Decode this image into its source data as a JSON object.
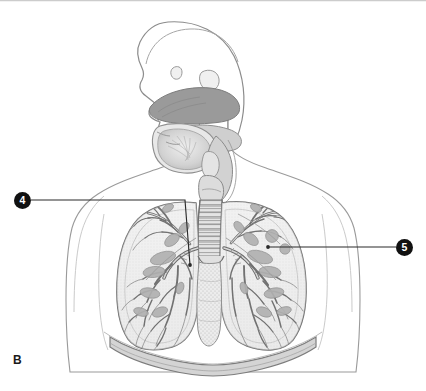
{
  "figure": {
    "panel_label": "B",
    "background_color": "#ffffff",
    "width": 426,
    "height": 391
  },
  "callouts": [
    {
      "id": "4",
      "label": "4",
      "marker_color": "#111111",
      "text_color": "#ffffff",
      "marker_x": 22,
      "marker_y": 200,
      "leader_points": "31,200 185,200 190,265",
      "target_x": 190,
      "target_y": 265,
      "target_region": "left-lung-hilum-primary-bronchus"
    },
    {
      "id": "5",
      "label": "5",
      "marker_color": "#111111",
      "text_color": "#ffffff",
      "marker_x": 404,
      "marker_y": 247,
      "leader_points": "396,247 268,247",
      "target_x": 268,
      "target_y": 247,
      "target_region": "right-lung-bronchial-tree"
    }
  ],
  "palette": {
    "outline": "#8c8c8c",
    "dark_outline": "#5a5a5a",
    "leader_line": "#2b2b2b",
    "fill_light": "#f2f2f2",
    "fill_mid": "#d6d6d6",
    "fill_gray": "#b8b8b8",
    "fill_dark": "#9a9a9a",
    "tissue_gray": "#a8a8a8",
    "stipple": "#c9c9c9",
    "border_top": "#cccccc"
  },
  "anatomy_parts": [
    "head-outline",
    "nasal-cavity",
    "nasal-turbinates",
    "hard-palate",
    "tongue",
    "oral-cavity",
    "pharynx",
    "epiglottis",
    "larynx",
    "trachea",
    "carina",
    "left-primary-bronchus",
    "right-primary-bronchus",
    "left-lung",
    "right-lung",
    "bronchial-tree",
    "mediastinum",
    "diaphragm",
    "thorax-outline",
    "shoulder-outline"
  ]
}
